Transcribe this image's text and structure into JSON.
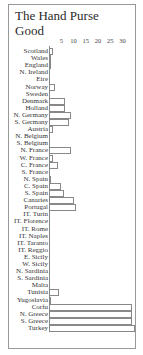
{
  "chart_data": {
    "type": "bar",
    "orientation": "horizontal",
    "title": "The Hand Purse Good",
    "xlabel": "",
    "ylabel": "",
    "xlim": [
      0,
      35
    ],
    "x_ticks": [
      5,
      10,
      15,
      20,
      25,
      30
    ],
    "grid": false,
    "legend": null,
    "categories": [
      "Scotland",
      "Wales",
      "England",
      "N. Ireland",
      "Eire",
      "Norway",
      "Sweden",
      "Denmark",
      "Holland",
      "N. Germany",
      "S. Germany",
      "Austria",
      "N. Belgium",
      "S. Belgium",
      "N. France",
      "W. France",
      "C. France",
      "S. France",
      "N. Spain",
      "C. Spain",
      "S. Spain",
      "Canaries",
      "Portugal",
      "IT. Turin",
      "IT. Florence",
      "IT. Rome",
      "IT. Naples",
      "IT. Taranto",
      "IT. Reggio",
      "E. Sicily",
      "W. Sicily",
      "N. Sardinia",
      "S. Sardinia",
      "Malta",
      "Tunisia",
      "Yugoslavia",
      "Corfu",
      "N. Greece",
      "S. Greece",
      "Turkey"
    ],
    "values": [
      1.5,
      0.5,
      1,
      0,
      0,
      2.5,
      0,
      6.5,
      6.5,
      9,
      8,
      1.5,
      0,
      0,
      9,
      1.5,
      3.5,
      0,
      1,
      5,
      6,
      10,
      11,
      0,
      0,
      0,
      0,
      0,
      0,
      0,
      0,
      0,
      0,
      0,
      4,
      1,
      34,
      34,
      34,
      35
    ]
  },
  "title_line1": "The Hand Purse",
  "title_line2": "Good"
}
